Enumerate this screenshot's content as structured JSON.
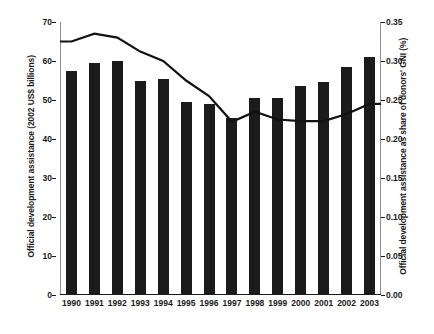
{
  "chart_data": {
    "type": "bar",
    "title": "",
    "subtitle": "",
    "categories": [
      "1990",
      "1991",
      "1992",
      "1993",
      "1994",
      "1995",
      "1996",
      "1997",
      "1998",
      "1999",
      "2000",
      "2001",
      "2002",
      "2003"
    ],
    "xlabel": "",
    "grid": false,
    "legend": "none",
    "series": [
      {
        "name": "Official development assistance (2002 US$ billions)",
        "type": "bar",
        "axis": "left",
        "color": "#1b1b1b",
        "values": [
          57.5,
          59.5,
          60.0,
          55.0,
          55.5,
          49.5,
          49.0,
          45.5,
          50.5,
          50.5,
          53.5,
          54.5,
          58.5,
          61.0
        ]
      },
      {
        "name": "Official development assistance as share of donors' GNI (%)",
        "type": "line",
        "axis": "right",
        "color": "#121212",
        "values": [
          0.325,
          0.335,
          0.33,
          0.312,
          0.3,
          0.275,
          0.255,
          0.222,
          0.235,
          0.225,
          0.223,
          0.223,
          0.232,
          0.245
        ]
      }
    ],
    "left_axis": {
      "label": "Official development assistance (2002 US$ billions)",
      "ticks": [
        "0",
        "10",
        "20",
        "30",
        "40",
        "50",
        "60",
        "70"
      ],
      "tick_values": [
        0,
        10,
        20,
        30,
        40,
        50,
        60,
        70
      ],
      "ylim": [
        0,
        70
      ]
    },
    "right_axis": {
      "label": "Official development assistance as share of donors' GNI (%)",
      "ticks": [
        "0.00",
        "0.05",
        "0.10",
        "0.15",
        "0.20",
        "0.25",
        "0.30",
        "0.35"
      ],
      "tick_values": [
        0.0,
        0.05,
        0.1,
        0.15,
        0.2,
        0.25,
        0.3,
        0.35
      ],
      "ylim": [
        0,
        0.35
      ]
    }
  }
}
